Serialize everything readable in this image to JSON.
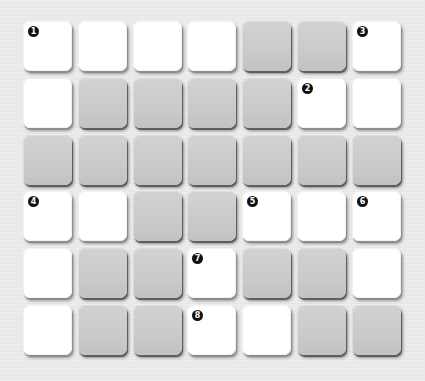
{
  "puzzle": {
    "type": "crossword-grid",
    "columns": 7,
    "rows": 6,
    "legend": {
      "W": "open-cell",
      "G": "blocked-cell"
    },
    "grid": [
      [
        "W",
        "W",
        "W",
        "W",
        "G",
        "G",
        "W"
      ],
      [
        "W",
        "G",
        "G",
        "G",
        "G",
        "W",
        "W"
      ],
      [
        "G",
        "G",
        "G",
        "G",
        "G",
        "G",
        "G"
      ],
      [
        "W",
        "W",
        "G",
        "G",
        "W",
        "W",
        "W"
      ],
      [
        "W",
        "G",
        "G",
        "W",
        "G",
        "G",
        "W"
      ],
      [
        "W",
        "G",
        "G",
        "W",
        "W",
        "G",
        "G"
      ]
    ],
    "clue_numbers": [
      {
        "number": "1",
        "row": 0,
        "col": 0
      },
      {
        "number": "3",
        "row": 0,
        "col": 6
      },
      {
        "number": "2",
        "row": 1,
        "col": 5
      },
      {
        "number": "4",
        "row": 3,
        "col": 0
      },
      {
        "number": "5",
        "row": 3,
        "col": 4
      },
      {
        "number": "6",
        "row": 3,
        "col": 6
      },
      {
        "number": "7",
        "row": 4,
        "col": 3
      },
      {
        "number": "8",
        "row": 5,
        "col": 3
      }
    ],
    "colors": {
      "open": "#ffffff",
      "blocked": "#cacaca",
      "background": "#e9e9e9",
      "number_badge": "#111111"
    }
  }
}
